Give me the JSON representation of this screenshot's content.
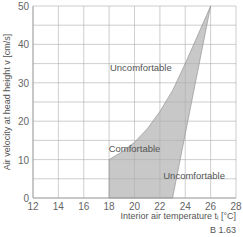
{
  "chart_data": {
    "type": "area",
    "title": "",
    "xlabel": "Interior air temperature t_i [°C]",
    "ylabel": "Air velocity at head height v [cm/s]",
    "xlim": [
      12,
      28
    ],
    "ylim": [
      0,
      50
    ],
    "xticks": [
      "12",
      "14",
      "16",
      "18",
      "20",
      "22",
      "24",
      "26",
      "28"
    ],
    "yticks": [
      "0",
      "10",
      "20",
      "30",
      "40",
      "50"
    ],
    "grid": true,
    "comfort_zone_polygon": [
      {
        "x": 18,
        "y": 0
      },
      {
        "x": 18,
        "y": 10
      },
      {
        "x": 19,
        "y": 12
      },
      {
        "x": 20,
        "y": 14.5
      },
      {
        "x": 21,
        "y": 18
      },
      {
        "x": 22,
        "y": 22.5
      },
      {
        "x": 23,
        "y": 28
      },
      {
        "x": 24,
        "y": 35
      },
      {
        "x": 26,
        "y": 50
      },
      {
        "x": 23,
        "y": 0
      }
    ],
    "annotations": [
      {
        "text": "Uncomfortable",
        "x": 20.5,
        "y": 33
      },
      {
        "text": "Comfortable",
        "x": 20,
        "y": 12
      },
      {
        "text": "Uncomfortable",
        "x": 24.7,
        "y": 5
      }
    ],
    "fill_color": "#c8c8c8",
    "figure_id": "B 1.63"
  }
}
